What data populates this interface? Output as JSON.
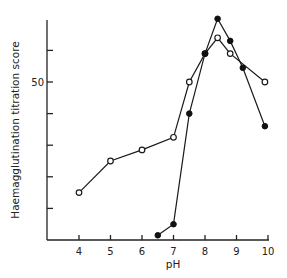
{
  "chart_data": {
    "type": "line",
    "title": "",
    "xlabel": "pH",
    "ylabel": "Haemagglutination titration score",
    "xlim": [
      3,
      10
    ],
    "ylim": [
      0,
      70
    ],
    "x_ticks": [
      4,
      5,
      6,
      7,
      8,
      9,
      10
    ],
    "x_tick_labels": [
      "4",
      "5",
      "6",
      "7",
      "8",
      "9",
      "10"
    ],
    "y_ticks": [
      0,
      10,
      20,
      30,
      40,
      50,
      60,
      70
    ],
    "y_tick_labels": [
      "",
      "",
      "",
      "",
      "",
      "50",
      "",
      ""
    ],
    "grid": false,
    "legend": null,
    "series": [
      {
        "name": "open circles",
        "marker": "open-circle",
        "x": [
          4,
          5,
          6,
          7,
          7.5,
          8,
          8.4,
          8.8,
          9.9
        ],
        "values": [
          15,
          25,
          28.5,
          32.5,
          50,
          59,
          64,
          59,
          50
        ]
      },
      {
        "name": "filled circles",
        "marker": "filled-circle",
        "x": [
          6.5,
          7,
          7.5,
          8,
          8.4,
          8.8,
          9.2,
          9.9
        ],
        "values": [
          1.5,
          5,
          40,
          59,
          70,
          63,
          54.5,
          36
        ]
      }
    ]
  }
}
